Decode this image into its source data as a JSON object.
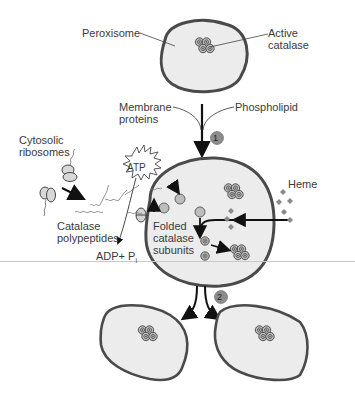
{
  "labels": {
    "peroxisome": "Peroxisome",
    "active_catalase_1": "Active",
    "active_catalase_2": "catalase",
    "membrane_proteins_1": "Membrane",
    "membrane_proteins_2": "proteins",
    "phospholipid": "Phospholipid",
    "cytosolic_ribosomes_1": "Cytosolic",
    "cytosolic_ribosomes_2": "ribosomes",
    "atp": "ATP",
    "catalase_polypeptides_1": "Catalase",
    "catalase_polypeptides_2": "polypeptides",
    "adp_pi": "ADP+ P",
    "pi_subscript": "i",
    "folded_subunits_1": "Folded",
    "folded_subunits_2": "catalase",
    "folded_subunits_3": "subunits",
    "heme": "Heme"
  },
  "steps": [
    {
      "number": "1"
    },
    {
      "number": "2"
    }
  ],
  "colors": {
    "organelle_fill": "#ececec",
    "organelle_stroke": "#4a4a4a",
    "step_badge": "#8c8c8c",
    "subunit_fill": "#bdbdbd",
    "text": "#3a3a3a"
  }
}
